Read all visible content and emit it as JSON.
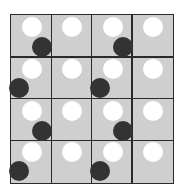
{
  "figure": {
    "rows": 4,
    "cols": 4,
    "colors": {
      "cell_background": "#cfcfcf",
      "grid_line": "#2a2a2a",
      "white_circle": "#ffffff",
      "black_circle": "#333333",
      "page_background": "#ffffff"
    },
    "cells": [
      [
        {
          "white": true,
          "black": "bottom-right"
        },
        {
          "white": true,
          "black": null
        },
        {
          "white": true,
          "black": "bottom-right"
        },
        {
          "white": true,
          "black": null
        }
      ],
      [
        {
          "white": true,
          "black": "bottom-left"
        },
        {
          "white": true,
          "black": null
        },
        {
          "white": true,
          "black": "bottom-left"
        },
        {
          "white": true,
          "black": null
        }
      ],
      [
        {
          "white": true,
          "black": "bottom-right"
        },
        {
          "white": true,
          "black": null
        },
        {
          "white": true,
          "black": "bottom-right"
        },
        {
          "white": true,
          "black": null
        }
      ],
      [
        {
          "white": true,
          "black": "bottom-left"
        },
        {
          "white": true,
          "black": null
        },
        {
          "white": true,
          "black": "bottom-left"
        },
        {
          "white": true,
          "black": null
        }
      ]
    ]
  }
}
